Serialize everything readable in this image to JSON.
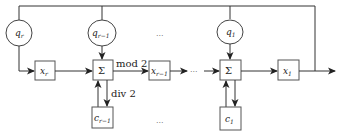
{
  "diagram": {
    "type": "block-diagram",
    "nodes": {
      "q_r": {
        "label": "q",
        "sub": "r"
      },
      "q_r_minus_1": {
        "label": "q",
        "sub": "r−1"
      },
      "q_1": {
        "label": "q",
        "sub": "1"
      },
      "x_r": {
        "label": "x",
        "sub": "r"
      },
      "x_r_minus_1": {
        "label": "x",
        "sub": "r−1"
      },
      "x_1": {
        "label": "x",
        "sub": "1"
      },
      "sum_1": {
        "label": "Σ"
      },
      "sum_2": {
        "label": "Σ"
      },
      "c_r_minus_1": {
        "label": "c",
        "sub": "r−1"
      },
      "c_1": {
        "label": "c",
        "sub": "1"
      }
    },
    "edge_labels": {
      "mod": "mod 2",
      "div": "div 2"
    },
    "ellipsis": "···"
  }
}
